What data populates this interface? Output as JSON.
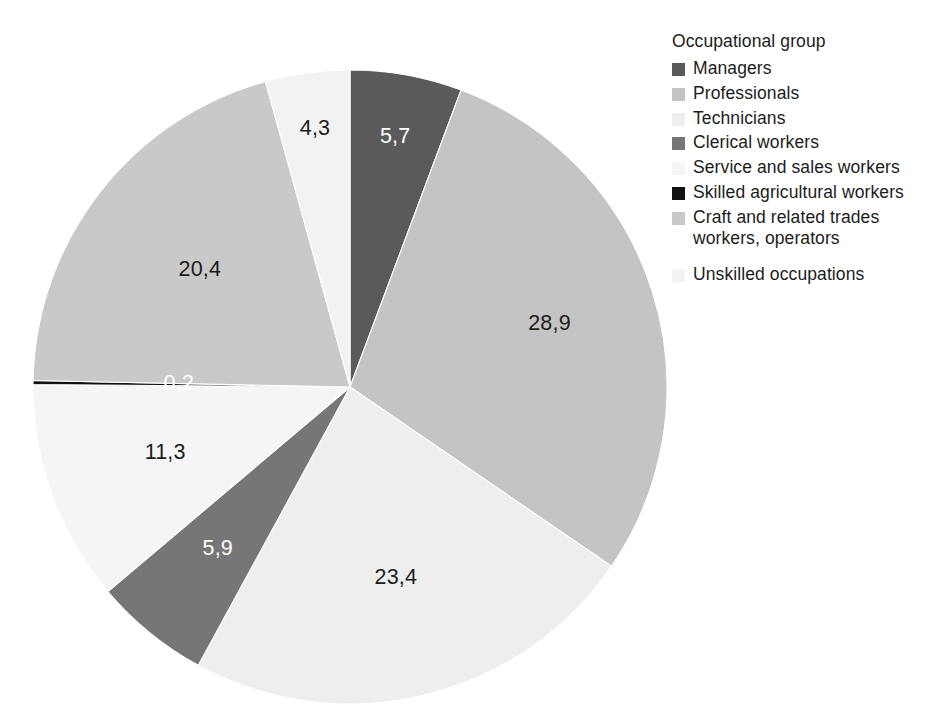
{
  "legend": {
    "title": "Occupational group",
    "position": "right"
  },
  "chart_data": {
    "type": "pie",
    "title": "",
    "subtitle": "",
    "xlabel": "",
    "ylabel": "",
    "legend_title": "Occupational group",
    "legend_position": "right",
    "grid": false,
    "decimal_separator": ",",
    "units": "percent",
    "start_angle_deg": 0,
    "direction": "clockwise",
    "categories": [
      "Managers",
      "Professionals",
      "Technicians",
      "Clerical workers",
      "Service and sales workers",
      "Skilled agricultural workers",
      "Craft and related trades workers, operators",
      "Unskilled occupations"
    ],
    "values": [
      5.7,
      28.9,
      23.4,
      5.9,
      11.3,
      0.2,
      20.4,
      4.3
    ],
    "value_labels": [
      "5,7",
      "28,9",
      "23,4",
      "5,9",
      "11,3",
      "0,2",
      "20,4",
      "4,3"
    ],
    "colors": [
      "#5a5a5a",
      "#c4c4c4",
      "#eeeeee",
      "#767676",
      "#f5f5f5",
      "#111111",
      "#c9c9c9",
      "#f2f2f2"
    ],
    "label_text_colors": [
      "#ffffff",
      "#1c1c1c",
      "#1c1c1c",
      "#ffffff",
      "#1c1c1c",
      "#ffffff",
      "#1c1c1c",
      "#1c1c1c"
    ],
    "slices": [
      {
        "label": "Managers",
        "value": 5.7,
        "value_label": "5,7",
        "color": "#5a5a5a",
        "text_on": "dark",
        "label_radius_frac": 0.8,
        "legend_break_before": false
      },
      {
        "label": "Professionals",
        "value": 28.9,
        "value_label": "28,9",
        "color": "#c4c4c4",
        "text_on": "light",
        "label_radius_frac": 0.66,
        "legend_break_before": false
      },
      {
        "label": "Technicians",
        "value": 23.4,
        "value_label": "23,4",
        "color": "#eeeeee",
        "text_on": "light",
        "label_radius_frac": 0.62,
        "legend_break_before": false
      },
      {
        "label": "Clerical workers",
        "value": 5.9,
        "value_label": "5,9",
        "color": "#767676",
        "text_on": "dark",
        "label_radius_frac": 0.66,
        "legend_break_before": false
      },
      {
        "label": "Service and sales workers",
        "value": 11.3,
        "value_label": "11,3",
        "color": "#f5f5f5",
        "text_on": "light",
        "label_radius_frac": 0.62,
        "legend_break_before": false
      },
      {
        "label": "Skilled agricultural workers",
        "value": 0.2,
        "value_label": "0,2",
        "color": "#111111",
        "text_on": "dark",
        "label_radius_frac": 0.54,
        "legend_break_before": false
      },
      {
        "label": "Craft and related trades workers, operators",
        "value": 20.4,
        "value_label": "20,4",
        "color": "#c9c9c9",
        "text_on": "light",
        "label_radius_frac": 0.6,
        "legend_break_before": false
      },
      {
        "label": "Unskilled occupations",
        "value": 4.3,
        "value_label": "4,3",
        "color": "#f2f2f2",
        "text_on": "light",
        "label_radius_frac": 0.82,
        "legend_break_before": true
      }
    ],
    "total": 100.1,
    "geometry": {
      "center_x": 350,
      "center_y": 387,
      "radius": 317
    }
  }
}
